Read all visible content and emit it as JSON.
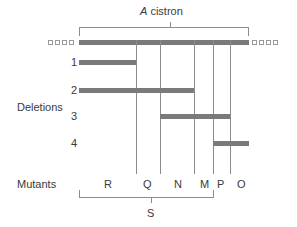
{
  "cistron": {
    "prefix": "A",
    "label": "cistron"
  },
  "deletions": {
    "title": "Deletions",
    "items": [
      {
        "label": "1",
        "start": "R",
        "end": "R"
      },
      {
        "label": "2",
        "start": "R",
        "end": "N"
      },
      {
        "label": "3",
        "start": "N",
        "end": "P"
      },
      {
        "label": "4",
        "start": "P",
        "end": "O"
      }
    ]
  },
  "mutants": {
    "title": "Mutants",
    "items": [
      "R",
      "Q",
      "N",
      "M",
      "P",
      "O"
    ]
  },
  "group": {
    "label": "S",
    "members": [
      "R",
      "Q",
      "N",
      "M"
    ]
  },
  "colors": {
    "bar": "#7a7a7a",
    "line": "#8c8c8c",
    "text": "#3a3a3a"
  }
}
